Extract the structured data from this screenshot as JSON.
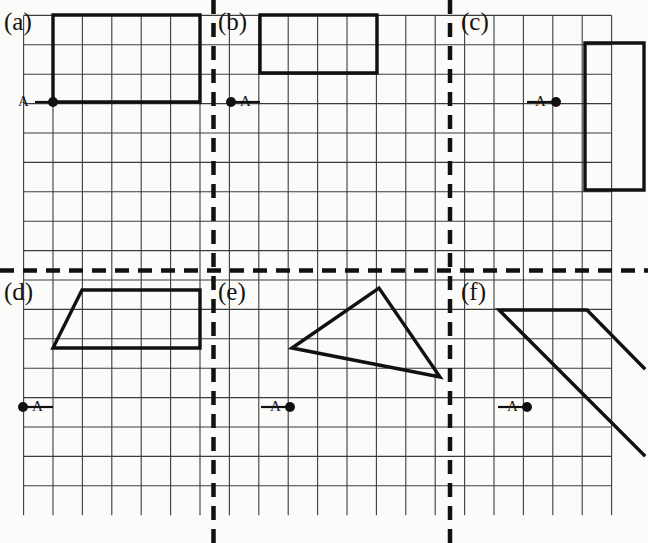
{
  "figure": {
    "width": 648,
    "height": 543,
    "background_color": "#fbfbf9",
    "grid": {
      "line_color": "#3c3c3c",
      "line_width": 1.1,
      "cell_size": 29.4,
      "origin_x": 23.6,
      "origin_y": 15.4,
      "columns": 21,
      "rows": 17
    },
    "divider_color": "#111111",
    "shape_color": "#111111",
    "point_color": "#111111",
    "dividers": {
      "vertical_x": [
        213.5,
        450.0
      ],
      "horizontal_y": [
        270.5
      ],
      "dash": "14 9",
      "width": 4.5
    },
    "panels": [
      {
        "id": "a",
        "label": "(a)",
        "label_x": 4,
        "label_y": 8,
        "point_label": "A",
        "point_label_x": 18,
        "point_label_y": 93,
        "point_x": 53,
        "point_y": 102,
        "point_radius": 5,
        "tick": {
          "x1": 35,
          "y1": 102,
          "x2": 53,
          "y2": 102
        },
        "shape_type": "rectangle",
        "shape_points": "53,15 200,15 200,102 53,102",
        "closed": true,
        "description": "Rectangle 5 cells wide by 3 cells tall with point A at its lower-left corner"
      },
      {
        "id": "b",
        "label": "(b)",
        "label_x": 218,
        "label_y": 8,
        "point_label": "A",
        "point_label_x": 240,
        "point_label_y": 93,
        "point_x": 231,
        "point_y": 102,
        "point_radius": 5,
        "tick": {
          "x1": 231,
          "y1": 102,
          "x2": 260,
          "y2": 102
        },
        "shape_type": "rectangle",
        "shape_points": "260,15 377,15 377,73 260,73",
        "closed": true,
        "description": "Rectangle 4 cells wide by 2 cells tall sitting above and right of point A"
      },
      {
        "id": "c",
        "label": "(c)",
        "label_x": 461,
        "label_y": 8,
        "point_label": "A",
        "point_label_x": 535,
        "point_label_y": 93,
        "point_x": 556,
        "point_y": 102,
        "point_radius": 5,
        "tick": {
          "x1": 527,
          "y1": 102,
          "x2": 556,
          "y2": 102
        },
        "shape_type": "rectangle",
        "shape_points": "585,43 644,43 644,190 585,190",
        "closed": true,
        "description": "Tall rectangle 2 cells wide by 5 cells tall to the right of point A"
      },
      {
        "id": "d",
        "label": "(d)",
        "label_x": 4,
        "label_y": 278,
        "point_label": "A",
        "point_label_x": 32,
        "point_label_y": 398,
        "point_x": 23,
        "point_y": 407,
        "point_radius": 5,
        "tick": {
          "x1": 23,
          "y1": 407,
          "x2": 53,
          "y2": 407
        },
        "shape_type": "trapezoid",
        "shape_points": "82,290 200,290 200,348 53,348",
        "closed": true,
        "description": "Trapezoid with slanted left side, flat top and bottom"
      },
      {
        "id": "e",
        "label": "(e)",
        "label_x": 218,
        "label_y": 278,
        "point_label": "A",
        "point_label_x": 270,
        "point_label_y": 398,
        "point_x": 290,
        "point_y": 407,
        "point_radius": 5,
        "tick": {
          "x1": 261,
          "y1": 407,
          "x2": 290,
          "y2": 407
        },
        "shape_type": "triangle",
        "shape_points": "292,348 379,288 440,377",
        "closed": true,
        "description": "Scalene triangle with apex near the top middle of the panel"
      },
      {
        "id": "f",
        "label": "(f)",
        "label_x": 461,
        "label_y": 278,
        "point_label": "A",
        "point_label_x": 507,
        "point_label_y": 398,
        "point_x": 527,
        "point_y": 407,
        "point_radius": 5,
        "tick": {
          "x1": 498,
          "y1": 407,
          "x2": 527,
          "y2": 407
        },
        "shape_type": "open-parallelogram",
        "shape_points": "644,455 499,310 587,310 644,368",
        "closed": false,
        "description": "Open polyline forming two parallel diagonals joined by a horizontal top edge"
      }
    ]
  }
}
